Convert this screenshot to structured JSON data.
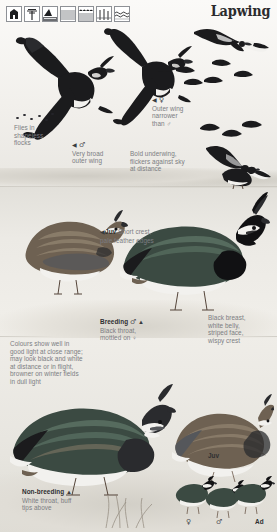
{
  "page": {
    "title": "Lapwing",
    "background_color": "#f1efea"
  },
  "habitat_icons": [
    {
      "name": "building-habitat-icon",
      "label": "buildings"
    },
    {
      "name": "tree-habitat-icon",
      "label": "trees"
    },
    {
      "name": "cliff-coast-habitat-icon",
      "label": "cliff-coast"
    },
    {
      "name": "farmland-habitat-icon",
      "label": "farmland"
    },
    {
      "name": "marsh-habitat-icon",
      "label": "marsh"
    },
    {
      "name": "reedbed-habitat-icon",
      "label": "reedbed"
    },
    {
      "name": "open-water-habitat-icon",
      "label": "open-water"
    }
  ],
  "annotations": {
    "flock": {
      "lines": [
        "Flies in",
        "shapeless",
        "flocks"
      ]
    },
    "outer_wing_female": {
      "marker": "◀",
      "symbol": "♀",
      "lines": [
        "Outer wing",
        "narrower",
        "than ♂"
      ]
    },
    "very_broad": {
      "marker": "◀",
      "symbol": "♂",
      "lines": [
        "Very broad",
        "outer wing"
      ]
    },
    "bold_underwing": {
      "lines": [
        "Bold underwing,",
        "flickers against sky",
        "at distance"
      ]
    },
    "juv_mid": {
      "marker": "◀",
      "lead": "Juv",
      "text": "Short crest,",
      "line2": "pale feather edges"
    },
    "breeding": {
      "lead": "Breeding",
      "symbol": "♂",
      "marker": "▲",
      "lines": [
        "Black throat,",
        "mottled on ♀"
      ]
    },
    "colours": {
      "lines": [
        "Colours show well in",
        "good light at close range;",
        "may look black and white",
        "at distance or in flight,",
        "browner on winter fields",
        "in dull light"
      ]
    },
    "breast": {
      "lines": [
        "Black breast,",
        "white belly,",
        "striped face,",
        "wispy crest"
      ]
    },
    "juv_lower": {
      "label": "Juv"
    },
    "non_breeding": {
      "lead": "Non-breeding",
      "marker": "▲",
      "lines": [
        "White throat, buff",
        "tips above"
      ]
    },
    "ad_lower": {
      "label": "Ad"
    },
    "sex_symbols": {
      "female": "♀",
      "male": "♂"
    }
  },
  "colors": {
    "plumage_dark": "#1b1b1d",
    "plumage_mid": "#55575b",
    "plumage_light": "#f2f1ee",
    "warm_buff": "#6e6152",
    "green_gloss": "#3b4a42",
    "text_grey": "#7b7d82",
    "text_dark": "#2e2f31"
  }
}
